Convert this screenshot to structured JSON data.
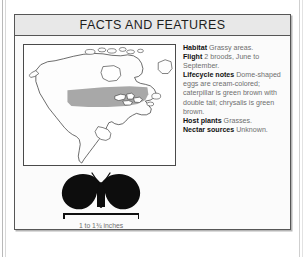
{
  "panel": {
    "title": "FACTS AND FEATURES"
  },
  "facts": [
    {
      "label": "Habitat",
      "value": "Grassy areas."
    },
    {
      "label": "Flight",
      "value": "2 broods, June to September."
    },
    {
      "label": "Lifecycle notes",
      "value": "Dome-shaped eggs are cream-colored; caterpillar is green brown with double tail; chrysalis is green brown."
    },
    {
      "label": "Host plants",
      "value": "Grasses."
    },
    {
      "label": "Nectar sources",
      "value": "Unknown."
    }
  ],
  "map": {
    "region_name": "north-america",
    "range_shading_color": "#a8a8a8",
    "land_fill_color": "#fdfdfd",
    "outline_color": "#2a2a2a"
  },
  "specimen": {
    "silhouette_name": "butterfly-silhouette",
    "silhouette_color": "#0d0d0d",
    "scale_caption": "1 to 1¾ inches"
  }
}
